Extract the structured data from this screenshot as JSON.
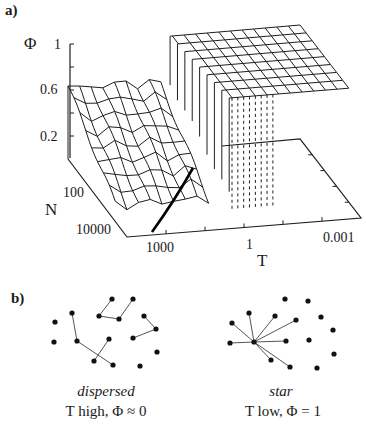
{
  "panel_a": {
    "label": "a)",
    "z_axis": {
      "title": "Φ",
      "ticks": [
        {
          "label": "1",
          "x": 54,
          "y": 37
        },
        {
          "label": "0.6",
          "x": 40,
          "y": 82
        },
        {
          "label": "0.2",
          "x": 40,
          "y": 129
        }
      ]
    },
    "n_axis": {
      "title": "N",
      "ticks": [
        {
          "label": "100",
          "x": 63,
          "y": 185
        },
        {
          "label": "10000",
          "x": 76,
          "y": 222
        }
      ]
    },
    "t_axis": {
      "title": "T",
      "ticks": [
        {
          "label": "1000",
          "x": 146,
          "y": 240
        },
        {
          "label": "1",
          "x": 246,
          "y": 237
        },
        {
          "label": "0.001",
          "x": 323,
          "y": 230
        }
      ]
    }
  },
  "panel_b": {
    "label": "b)",
    "dispersed": {
      "title": "dispersed",
      "subtitle": "T high, Φ ≈ 0"
    },
    "star": {
      "title": "star",
      "subtitle": "T low, Φ = 1"
    }
  },
  "chart_data": [
    {
      "type": "surface",
      "title": "",
      "xlabel": "T",
      "ylabel": "N",
      "zlabel": "Φ",
      "x_ticks": [
        "1000",
        "1",
        "0.001"
      ],
      "x_scale": "log",
      "y_ticks": [
        "100",
        "10000"
      ],
      "y_scale": "log",
      "z_ticks": [
        "0.2",
        "0.6",
        "1"
      ],
      "zlim": [
        0,
        1
      ],
      "description": "Order parameter Φ vs temperature T and size N: Φ low (~0-0.6) at high T, sharp transition near T≈1-10 to Φ=1 plateau at low T; thick curve marks transition line",
      "grid_u": [
        0,
        0.05,
        0.1,
        0.15,
        0.2,
        0.25,
        0.3,
        0.35,
        0.4,
        0.45,
        0.5,
        0.55,
        0.6,
        0.65,
        0.7,
        0.75,
        0.8,
        0.85,
        0.9,
        0.95,
        1.0
      ],
      "grid_v": [
        0,
        0.1,
        0.2,
        0.3,
        0.4,
        0.5,
        0.6,
        0.7,
        0.8
      ],
      "low_region_phi_back": 0.62,
      "low_region_phi_front": 0.02,
      "transition_u": 0.44,
      "plateau_phi": 1.0
    },
    {
      "type": "network",
      "name": "dispersed",
      "nodes": [
        [
          112,
          299
        ],
        [
          133,
          299
        ],
        [
          72,
          313
        ],
        [
          99,
          316
        ],
        [
          119,
          319
        ],
        [
          144,
          316
        ],
        [
          156,
          329
        ],
        [
          55,
          322
        ],
        [
          54,
          342
        ],
        [
          77,
          341
        ],
        [
          109,
          339
        ],
        [
          133,
          338
        ],
        [
          157,
          352
        ],
        [
          94,
          361
        ],
        [
          113,
          365
        ],
        [
          140,
          366
        ]
      ],
      "edges": [
        [
          0,
          3
        ],
        [
          3,
          4
        ],
        [
          4,
          1
        ],
        [
          5,
          6
        ],
        [
          6,
          11
        ],
        [
          2,
          9
        ],
        [
          9,
          14
        ],
        [
          10,
          13
        ]
      ]
    },
    {
      "type": "network",
      "name": "star",
      "nodes": [
        [
          254,
          342
        ],
        [
          232,
          323
        ],
        [
          249,
          313
        ],
        [
          275,
          316
        ],
        [
          296,
          320
        ],
        [
          230,
          343
        ],
        [
          286,
          341
        ],
        [
          271,
          360
        ],
        [
          290,
          367
        ],
        [
          285,
          299
        ],
        [
          308,
          301
        ],
        [
          321,
          317
        ],
        [
          333,
          330
        ],
        [
          309,
          340
        ],
        [
          334,
          354
        ],
        [
          317,
          368
        ]
      ],
      "edges": [
        [
          0,
          1
        ],
        [
          0,
          2
        ],
        [
          0,
          3
        ],
        [
          0,
          4
        ],
        [
          0,
          5
        ],
        [
          0,
          6
        ],
        [
          0,
          7
        ],
        [
          0,
          8
        ]
      ]
    }
  ]
}
